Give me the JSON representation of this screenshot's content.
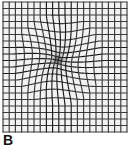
{
  "figure": {
    "panel_label": "B",
    "caption_text": "",
    "background_color": "#ffffff"
  },
  "chart_data": {
    "type": "heatmap",
    "title": "",
    "xlabel": "",
    "ylabel": "",
    "grid": true,
    "legend": null,
    "grid_spec": {
      "columns": 20,
      "rows": 20,
      "x_min": 3,
      "x_max": 127,
      "y_min": 2,
      "y_max": 132,
      "cell_width": 6.2,
      "cell_height": 6.5,
      "line_color": "#3a3a3a",
      "line_color_dark": "#1b1b1b",
      "line_width": 1.15,
      "cell_fill": "#f2f2f2",
      "border_color": "#3a3a3a"
    },
    "distortion": {
      "model": "radial_inward_pull",
      "center_x": 58,
      "center_y": 60,
      "strength": 0.62,
      "radius": 46,
      "core_radius": 9,
      "core_shade": "#2a2a2a",
      "core_opacity": 0.55,
      "sample_steps": 14
    },
    "annotations": [
      {
        "label": "B",
        "x": 3,
        "y": 133
      }
    ]
  }
}
